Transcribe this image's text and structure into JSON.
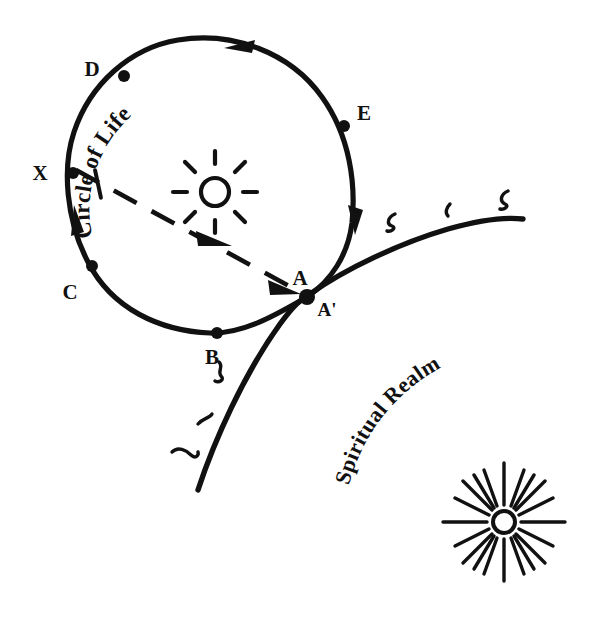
{
  "figure": {
    "title": "Circle of Life and Spiritual Realm diagram",
    "background_color": "#ffffff",
    "ink_color": "#111111",
    "width": 604,
    "height": 622
  },
  "labels": {
    "circle_of_life": "Circle of Life",
    "spiritual_realm": "Spiritual Realm"
  },
  "points": [
    {
      "id": "D",
      "label": "D",
      "x": 124,
      "y": 76,
      "label_x": 92,
      "label_y": 76
    },
    {
      "id": "X",
      "label": "X",
      "x": 73,
      "y": 173,
      "label_x": 40,
      "label_y": 178
    },
    {
      "id": "C",
      "label": "C",
      "x": 92,
      "y": 266,
      "label_x": 70,
      "label_y": 297
    },
    {
      "id": "B",
      "label": "B",
      "x": 217,
      "y": 333,
      "label_x": 210,
      "label_y": 362
    },
    {
      "id": "A",
      "label": "A",
      "x": 307,
      "y": 297,
      "label_x": 297,
      "label_y": 285
    },
    {
      "id": "Aprime",
      "label": "A'",
      "x": 307,
      "y": 297,
      "label_x": 317,
      "label_y": 314
    },
    {
      "id": "E",
      "label": "E",
      "x": 344,
      "y": 126,
      "label_x": 361,
      "label_y": 120
    }
  ],
  "suns": [
    {
      "id": "inner-sun",
      "cx": 215,
      "cy": 192,
      "core_radius": 14,
      "ray_count": 8
    },
    {
      "id": "spiritual-sun",
      "cx": 504,
      "cy": 522,
      "core_radius": 11,
      "ray_count": 20
    }
  ],
  "squiggle_marks": [
    {
      "id": "realm-mark-1",
      "x": 390,
      "y": 222
    },
    {
      "id": "realm-mark-2",
      "x": 447,
      "y": 210
    },
    {
      "id": "realm-mark-3",
      "x": 503,
      "y": 200
    },
    {
      "id": "realm-mark-4",
      "x": 222,
      "y": 370
    },
    {
      "id": "realm-mark-5",
      "x": 206,
      "y": 421
    },
    {
      "id": "realm-mark-6",
      "x": 184,
      "y": 454
    }
  ],
  "arrows": [
    {
      "id": "circle-arrow-top",
      "direction": "clockwise-right",
      "x": 245,
      "y": 44
    },
    {
      "id": "circle-arrow-right",
      "direction": "clockwise-down",
      "x": 356,
      "y": 223
    },
    {
      "id": "circle-arrow-left",
      "direction": "clockwise-up",
      "x": 77,
      "y": 216
    },
    {
      "id": "ray-arrow-mid",
      "direction": "toward-A",
      "x": 216,
      "y": 244
    },
    {
      "id": "ray-arrow-end",
      "direction": "toward-A",
      "x": 288,
      "y": 289
    }
  ]
}
